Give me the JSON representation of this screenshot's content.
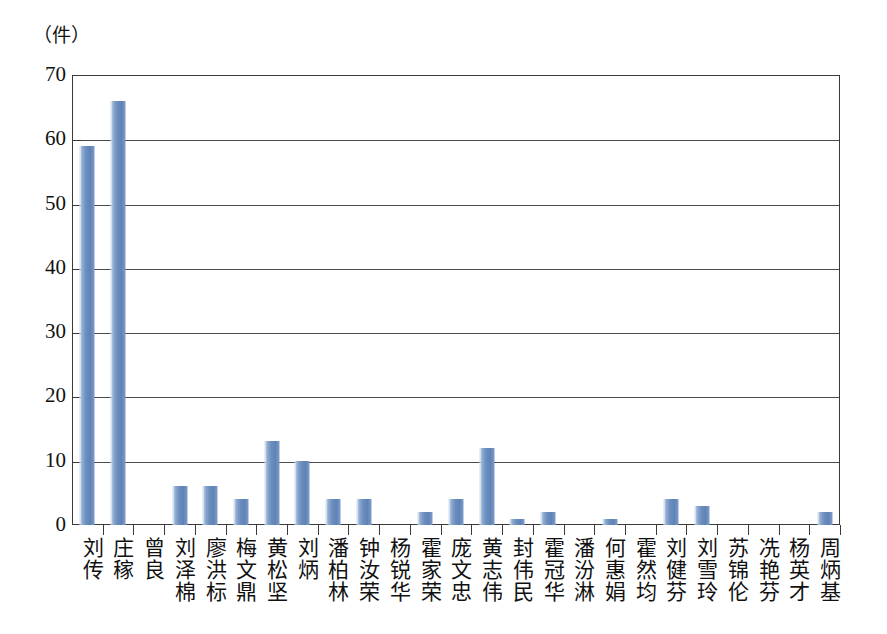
{
  "chart_data": {
    "type": "bar",
    "title": "",
    "subtitle": "",
    "xlabel": "",
    "ylabel": "（件）",
    "ylim": [
      0,
      70
    ],
    "yticks": [
      0,
      10,
      20,
      30,
      40,
      50,
      60,
      70
    ],
    "ytick_labels": [
      "0",
      "10",
      "20",
      "30",
      "40",
      "50",
      "60",
      "70"
    ],
    "grid": true,
    "grid_axis": "y",
    "legend": false,
    "legend_position": "none",
    "bar_color": "#6b8dbe",
    "bar_edge_color": "#cfdbeb",
    "axis_color": "#3a3a3a",
    "categories": [
      "刘传",
      "庄稼",
      "曾良",
      "刘泽棉",
      "廖洪标",
      "梅文鼎",
      "黄松坚",
      "刘炳",
      "潘柏林",
      "钟汝荣",
      "杨锐华",
      "霍家荣",
      "庞文忠",
      "黄志伟",
      "封伟民",
      "霍冠华",
      "潘汾淋",
      "何惠娟",
      "霍然均",
      "刘健芬",
      "刘雪玲",
      "苏锦伦",
      "冼艳芬",
      "杨英才",
      "周炳基"
    ],
    "values": [
      59,
      66,
      0,
      6,
      6,
      4,
      13,
      10,
      4,
      4,
      0,
      2,
      4,
      12,
      1,
      2,
      0,
      1,
      0,
      4,
      3,
      0,
      0,
      0,
      2
    ]
  }
}
